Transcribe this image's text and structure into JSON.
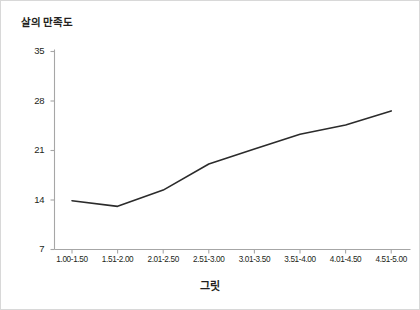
{
  "chart_data": {
    "type": "line",
    "title": "",
    "xlabel": "그릿",
    "ylabel": "살의 만족도",
    "categories": [
      "1.00-1.50",
      "1.51-2.00",
      "2.01-2.50",
      "2.51-3.00",
      "3.01-3.50",
      "3.51-4.00",
      "4.01-4.50",
      "4.51-5.00"
    ],
    "values": [
      13.9,
      13.1,
      15.4,
      19.1,
      21.2,
      23.3,
      24.6,
      26.6
    ],
    "yticks": [
      7,
      14,
      21,
      28,
      35
    ],
    "ylim": [
      7,
      35
    ],
    "grid": false,
    "legend": null,
    "series": [
      {
        "name": "살의 만족도",
        "values": [
          13.9,
          13.1,
          15.4,
          19.1,
          21.2,
          23.3,
          24.6,
          26.6
        ]
      }
    ],
    "line_color": "#2b2b2b",
    "axis_color": "#a6a6a6",
    "border_color": "#d8d8d8"
  }
}
